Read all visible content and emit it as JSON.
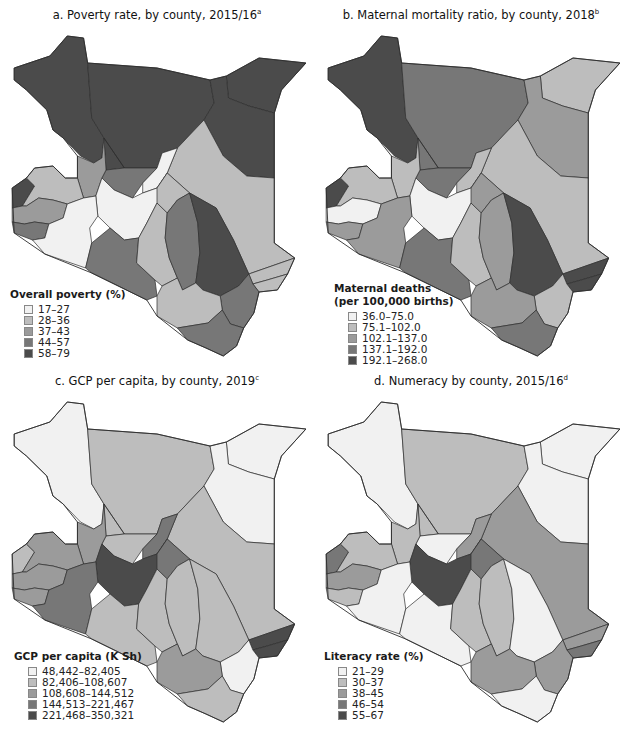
{
  "figure": {
    "header_cutoff": "",
    "colors": {
      "c1": "#f1f1f1",
      "c2": "#bdbdbd",
      "c3": "#9b9b9b",
      "c4": "#777777",
      "c5": "#4b4b4b",
      "border": "#2e2e2e"
    }
  },
  "panels": [
    {
      "title": "a. Poverty rate, by county, 2015/16",
      "footnote": "a",
      "legend": {
        "title_line1": "Overall poverty (%)",
        "title_line2": "",
        "items": [
          {
            "label": "17–27",
            "color": "#f1f1f1"
          },
          {
            "label": "28–36",
            "color": "#bdbdbd"
          },
          {
            "label": "37–43",
            "color": "#9b9b9b"
          },
          {
            "label": "44–57",
            "color": "#777777"
          },
          {
            "label": "58–79",
            "color": "#4b4b4b"
          }
        ]
      },
      "regions": {
        "nw": "c5",
        "n": "c5",
        "ne_top": "c5",
        "ne": "c5",
        "e": "c2",
        "ce": "c2",
        "tana": "c5",
        "kitui": "c4",
        "lamu": "c2",
        "kilifi": "c4",
        "kwale": "c4",
        "taita": "c2",
        "kajiado": "c4",
        "narok": "c1",
        "samburu": "c4",
        "baringo": "c3",
        "west": "c2",
        "central": "c1",
        "makueni": "c2",
        "isiolo": "c1",
        "meru": "c2",
        "westdark": "c5",
        "kisumu": "c3",
        "nyanza": "c4",
        "lamu_coast": "c2"
      }
    },
    {
      "title": "b. Maternal mortality ratio, by county, 2018",
      "footnote": "b",
      "legend": {
        "title_line1": "Maternal deaths",
        "title_line2": "(per 100,000 births)",
        "items": [
          {
            "label": "36.0–75.0",
            "color": "#f1f1f1"
          },
          {
            "label": "75.1–102.0",
            "color": "#bdbdbd"
          },
          {
            "label": "102.1–137.0",
            "color": "#9b9b9b"
          },
          {
            "label": "137.1–192.0",
            "color": "#777777"
          },
          {
            "label": "192.1–268.0",
            "color": "#4b4b4b"
          }
        ]
      },
      "regions": {
        "nw": "c5",
        "n": "c4",
        "ne_top": "c2",
        "ne": "c3",
        "e": "c2",
        "ce": "c2",
        "tana": "c5",
        "kitui": "c3",
        "lamu": "c5",
        "kilifi": "c2",
        "kwale": "c4",
        "taita": "c3",
        "kajiado": "c4",
        "narok": "c3",
        "samburu": "c4",
        "baringo": "c2",
        "west": "c2",
        "central": "c1",
        "makueni": "c2",
        "isiolo": "c2",
        "meru": "c3",
        "westdark": "c5",
        "kisumu": "c1",
        "nyanza": "c3",
        "lamu_coast": "c5"
      }
    },
    {
      "title": "c. GCP per capita, by county, 2019",
      "footnote": "c",
      "legend": {
        "title_line1": "GCP per capita (K Sh)",
        "title_line2": "",
        "items": [
          {
            "label": "48,442–82,405",
            "color": "#f1f1f1"
          },
          {
            "label": "82,406–108,607",
            "color": "#bdbdbd"
          },
          {
            "label": "108,608–144,512",
            "color": "#9b9b9b"
          },
          {
            "label": "144,513–221,467",
            "color": "#777777"
          },
          {
            "label": "221,468–350,321",
            "color": "#4b4b4b"
          }
        ]
      },
      "regions": {
        "nw": "c1",
        "n": "c2",
        "ne_top": "c1",
        "ne": "c1",
        "e": "c2",
        "ce": "c4",
        "tana": "c2",
        "kitui": "c2",
        "lamu": "c5",
        "kilifi": "c1",
        "kwale": "c2",
        "taita": "c3",
        "kajiado": "c2",
        "narok": "c4",
        "samburu": "c2",
        "baringo": "c3",
        "west": "c3",
        "central": "c5",
        "makueni": "c2",
        "isiolo": "c4",
        "meru": "c4",
        "westdark": "c2",
        "kisumu": "c3",
        "nyanza": "c3",
        "lamu_coast": "c5"
      }
    },
    {
      "title": "d. Numeracy by county, 2015/16",
      "footnote": "d",
      "legend": {
        "title_line1": "Literacy rate (%)",
        "title_line2": "",
        "items": [
          {
            "label": "21–29",
            "color": "#f1f1f1"
          },
          {
            "label": "30–37",
            "color": "#bdbdbd"
          },
          {
            "label": "38–45",
            "color": "#9b9b9b"
          },
          {
            "label": "46–54",
            "color": "#777777"
          },
          {
            "label": "55–67",
            "color": "#4b4b4b"
          }
        ]
      },
      "regions": {
        "nw": "c1",
        "n": "c2",
        "ne_top": "c1",
        "ne": "c1",
        "e": "c3",
        "ce": "c2",
        "tana": "c1",
        "kitui": "c2",
        "lamu": "c3",
        "kilifi": "c3",
        "kwale": "c1",
        "taita": "c3",
        "kajiado": "c1",
        "narok": "c1",
        "samburu": "c1",
        "baringo": "c2",
        "west": "c2",
        "central": "c5",
        "makueni": "c2",
        "isiolo": "c3",
        "meru": "c4",
        "westdark": "c4",
        "kisumu": "c3",
        "nyanza": "c2",
        "lamu_coast": "c4"
      }
    }
  ]
}
